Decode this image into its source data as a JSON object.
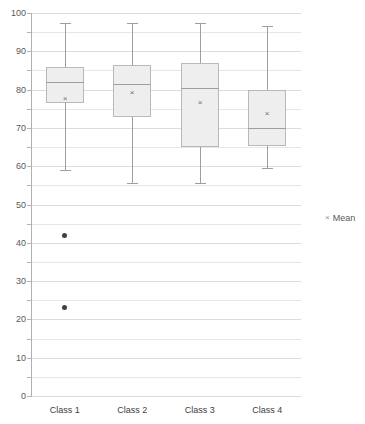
{
  "chart_data": {
    "type": "box",
    "title": "",
    "xlabel": "",
    "ylabel": "",
    "ylim": [
      0,
      100
    ],
    "ytick_step": 10,
    "minor_gridline_step": 5,
    "grid": true,
    "legend_position": "right",
    "legend": [
      {
        "marker": "x",
        "label": "Mean"
      }
    ],
    "categories": [
      "Class 1",
      "Class 2",
      "Class 3",
      "Class 4"
    ],
    "boxes": [
      {
        "category": "Class 1",
        "whisker_low": 59,
        "q1": 76.5,
        "median": 82,
        "q3": 86,
        "whisker_high": 97.5,
        "mean": 77.5,
        "outliers": [
          42,
          23
        ]
      },
      {
        "category": "Class 2",
        "whisker_low": 55.5,
        "q1": 73,
        "median": 81.5,
        "q3": 86.5,
        "whisker_high": 97.5,
        "mean": 79,
        "outliers": []
      },
      {
        "category": "Class 3",
        "whisker_low": 55.5,
        "q1": 65,
        "median": 80.5,
        "q3": 87,
        "whisker_high": 97.5,
        "mean": 76.5,
        "outliers": []
      },
      {
        "category": "Class 4",
        "whisker_low": 59.5,
        "q1": 65.5,
        "median": 70,
        "q3": 80,
        "whisker_high": 96.5,
        "mean": 73.5,
        "outliers": []
      }
    ],
    "ytick_labels": [
      "0",
      "10",
      "20",
      "30",
      "40",
      "50",
      "60",
      "70",
      "80",
      "90",
      "100"
    ],
    "colors": {
      "box_fill": "#eeeeee",
      "box_border": "#b9b9b9",
      "whisker": "#9e9e9e",
      "outlier": "#404040",
      "gridline": "#e6e6e6",
      "axis": "#b0b0b0",
      "text": "#595959"
    }
  }
}
